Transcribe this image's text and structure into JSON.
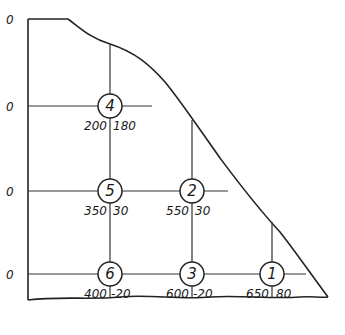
{
  "diagram": {
    "row_labels": [
      {
        "text": "0",
        "y": 19
      },
      {
        "text": "0",
        "y": 106
      },
      {
        "text": "0",
        "y": 191
      },
      {
        "text": "0",
        "y": 274
      }
    ],
    "nodes": [
      {
        "id": "4",
        "x": 110,
        "y": 106,
        "left_value": "200",
        "right_value": "180"
      },
      {
        "id": "5",
        "x": 110,
        "y": 191,
        "left_value": "350",
        "right_value": "30"
      },
      {
        "id": "2",
        "x": 192,
        "y": 191,
        "left_value": "550",
        "right_value": "30"
      },
      {
        "id": "6",
        "x": 110,
        "y": 274,
        "left_value": "400",
        "right_value": "-20"
      },
      {
        "id": "3",
        "x": 192,
        "y": 274,
        "left_value": "600",
        "right_value": "-20"
      },
      {
        "id": "1",
        "x": 272,
        "y": 274,
        "left_value": "650",
        "right_value": "80"
      }
    ],
    "colors": {
      "ink": "#222222",
      "background": "#ffffff"
    }
  }
}
